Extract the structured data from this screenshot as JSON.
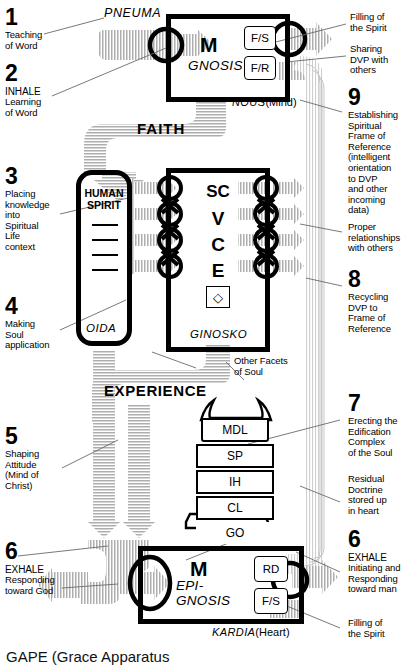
{
  "diagram": {
    "title": "GAPE (Grace Apparatus",
    "caption_note": "Grace Apparatus for Perception — diagram of the spiritual intake/output system"
  },
  "colors": {
    "ink": "#000000",
    "pipe_light": "#d9d9d9",
    "pipe_mid": "#b9b9b9",
    "leader": "#6a6a6a",
    "paper": "#ffffff"
  },
  "left_notes": [
    {
      "num": "1",
      "caption": "",
      "body": "Teaching\nof Word"
    },
    {
      "num": "2",
      "caption": "INHALE",
      "body": "Learning\nof Word"
    },
    {
      "num": "3",
      "caption": "",
      "body": "Placing\nknowledge\ninto\nSpiritual\nLife\ncontext"
    },
    {
      "num": "4",
      "caption": "",
      "body": "Making\nSoul\napplication"
    },
    {
      "num": "5",
      "caption": "",
      "body": "Shaping\nAttitude\n(Mind of\nChrist)"
    },
    {
      "num": "6",
      "caption": "EXHALE",
      "body": "Responding\ntoward God"
    }
  ],
  "right_notes": [
    {
      "num": "",
      "caption": "",
      "body": "Filling of\nthe Spirit"
    },
    {
      "num": "",
      "caption": "",
      "body": "Sharing\nDVP with\nothers"
    },
    {
      "num": "9",
      "caption": "",
      "body": "Establishing\nSpiritual\nFrame of\nReference\n(intelligent\norientation\nto DVP\nand other\nincoming\ndata)"
    },
    {
      "num": "",
      "caption": "",
      "body": "Proper\nrelationships\nwith others"
    },
    {
      "num": "8",
      "caption": "",
      "body": "Recycling\nDVP to\nFrame of\nReference"
    },
    {
      "num": "7",
      "caption": "",
      "body": "Erecting the\nEdification\nComplex\nof the Soul"
    },
    {
      "num": "",
      "caption": "",
      "body": "Residual\nDoctrine\nstored up\nin heart"
    },
    {
      "num": "6",
      "caption": "EXHALE",
      "body": "Initiating and\nResponding\ntoward man"
    },
    {
      "num": "",
      "caption": "",
      "body": "Filling of\nthe Spirit"
    }
  ],
  "pipes": {
    "pneuma": "PNEUMA",
    "faith": "FAITH",
    "experience": "EXPERIENCE"
  },
  "gnosis_box": {
    "m": "M",
    "name": "GNOSIS",
    "foot_italic": "NOUS",
    "foot_plain": "(Mind)",
    "tags": [
      "F/S",
      "F/R"
    ]
  },
  "spirit_box": {
    "title_line1": "HUMAN",
    "title_line2": "SPIRIT",
    "foot_italic": "OIDA",
    "dash_count": 4
  },
  "ginosko_box": {
    "stack": [
      "SC",
      "V",
      "C",
      "E"
    ],
    "symbol": "◇",
    "foot_italic": "GINOSKO",
    "side_label": "Other Facets\nof Soul"
  },
  "edification_tower": {
    "levels": [
      "MDL",
      "SP",
      "IH",
      "CL",
      "GO"
    ]
  },
  "kardia_box": {
    "m": "M",
    "name_line1": "EPI-",
    "name_line2": "GNOSIS",
    "foot_italic": "KARDIA",
    "foot_plain": "(Heart)",
    "tags": [
      "RD",
      "F/S"
    ]
  }
}
